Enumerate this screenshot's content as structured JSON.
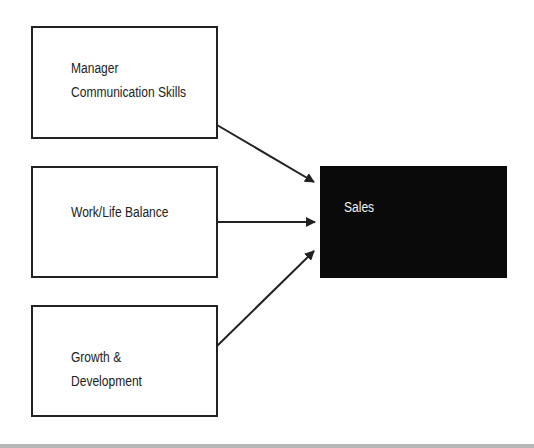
{
  "diagram": {
    "inputs": [
      {
        "lines": [
          "Manager",
          "Communication Skills"
        ]
      },
      {
        "lines": [
          "Work/Life Balance"
        ]
      },
      {
        "lines": [
          "Growth &",
          "Development"
        ]
      }
    ],
    "outcome": {
      "label": "Sales"
    },
    "colors": {
      "outline": "#222222",
      "outcome_fill": "#0a0a0a",
      "outcome_text": "#f2f2f2"
    }
  }
}
